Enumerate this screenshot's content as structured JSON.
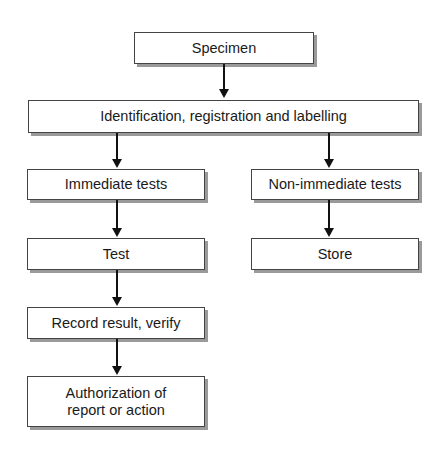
{
  "diagram": {
    "type": "flowchart",
    "nodes": [
      {
        "id": "specimen",
        "label": "Specimen"
      },
      {
        "id": "identification",
        "label": "Identification, registration and labelling"
      },
      {
        "id": "immediate",
        "label": "Immediate tests"
      },
      {
        "id": "non_immediate",
        "label": "Non-immediate tests"
      },
      {
        "id": "test",
        "label": "Test"
      },
      {
        "id": "store",
        "label": "Store"
      },
      {
        "id": "record",
        "label": "Record result, verify"
      },
      {
        "id": "authorization",
        "label": "Authorization of report or action"
      }
    ],
    "edges": [
      {
        "from": "specimen",
        "to": "identification"
      },
      {
        "from": "identification",
        "to": "immediate"
      },
      {
        "from": "identification",
        "to": "non_immediate"
      },
      {
        "from": "immediate",
        "to": "test"
      },
      {
        "from": "non_immediate",
        "to": "store"
      },
      {
        "from": "test",
        "to": "record"
      },
      {
        "from": "record",
        "to": "authorization"
      }
    ]
  },
  "labels": {
    "specimen": "Specimen",
    "identification": "Identification, registration and labelling",
    "immediate": "Immediate tests",
    "non_immediate": "Non-immediate tests",
    "test": "Test",
    "store": "Store",
    "record": "Record result, verify",
    "authorization": "Authorization of report or action"
  }
}
